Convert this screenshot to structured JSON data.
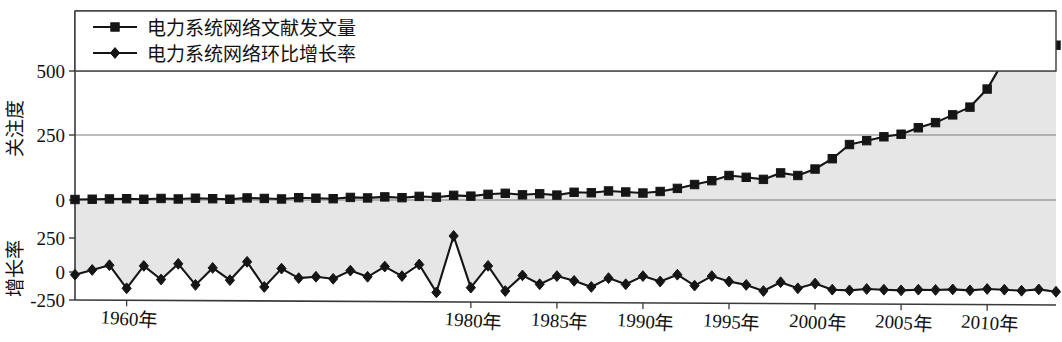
{
  "chart_data": {
    "type": "line",
    "title": "",
    "subtitle": "",
    "xlabel": "",
    "ylabel_top": "关注度",
    "ylabel_bottom": "增长率",
    "grid": true,
    "legend_position": "top-left",
    "panels": [
      {
        "name": "top",
        "ylabel": "关注度",
        "yticks": [
          0,
          250,
          500
        ],
        "ytick_labels": [
          "0",
          "250",
          "500"
        ],
        "ylim": [
          -40,
          660
        ],
        "fill": true,
        "fill_color": "#e6e6e6"
      },
      {
        "name": "bottom",
        "ylabel": "增长率",
        "yticks": [
          -250,
          0,
          250
        ],
        "ytick_labels": [
          "-250",
          "0",
          "250"
        ],
        "ylim": [
          -290,
          330
        ],
        "fill": false
      }
    ],
    "x": [
      1957,
      1958,
      1959,
      1960,
      1961,
      1962,
      1963,
      1964,
      1965,
      1966,
      1967,
      1968,
      1969,
      1970,
      1971,
      1972,
      1973,
      1974,
      1975,
      1976,
      1977,
      1978,
      1979,
      1980,
      1981,
      1982,
      1983,
      1984,
      1985,
      1986,
      1987,
      1988,
      1989,
      1990,
      1991,
      1992,
      1993,
      1994,
      1995,
      1996,
      1997,
      1998,
      1999,
      2000,
      2001,
      2002,
      2003,
      2004,
      2005,
      2006,
      2007,
      2008,
      2009,
      2010,
      2011,
      2012,
      2013,
      2014
    ],
    "xticks": [
      1960,
      1980,
      1985,
      1990,
      1995,
      2000,
      2005,
      2010
    ],
    "xtick_labels": [
      "1960年",
      "1980年",
      "1985年",
      "1990年",
      "1995年",
      "2000年",
      "2005年",
      "2010年"
    ],
    "series": [
      {
        "name": "电力系统网络文献发文量",
        "panel": "top",
        "marker": "square",
        "color": "#151515",
        "values": [
          2,
          3,
          4,
          5,
          3,
          6,
          4,
          7,
          5,
          3,
          8,
          6,
          4,
          9,
          7,
          5,
          10,
          8,
          12,
          9,
          14,
          11,
          18,
          15,
          22,
          26,
          20,
          24,
          19,
          30,
          28,
          35,
          31,
          27,
          33,
          45,
          60,
          75,
          95,
          88,
          80,
          105,
          95,
          120,
          160,
          215,
          230,
          245,
          255,
          280,
          300,
          330,
          360,
          430,
          545,
          600,
          605,
          600
        ]
      },
      {
        "name": "电力系统网络环比增长率",
        "panel": "bottom",
        "marker": "diamond",
        "color": "#151515",
        "values": [
          -20,
          15,
          50,
          -120,
          45,
          -55,
          60,
          -95,
          30,
          -60,
          75,
          -110,
          25,
          -45,
          -35,
          -50,
          10,
          -35,
          40,
          -30,
          55,
          -150,
          265,
          -115,
          45,
          -140,
          -25,
          -90,
          -30,
          -65,
          -110,
          -45,
          -90,
          -30,
          -70,
          -20,
          -100,
          -30,
          -70,
          -95,
          -140,
          -75,
          -120,
          -85,
          -130,
          -135,
          -125,
          -130,
          -135,
          -130,
          -132,
          -128,
          -135,
          -125,
          -130,
          -138,
          -128,
          -145
        ]
      }
    ]
  },
  "legend": {
    "entries": [
      {
        "label": "电力系统网络文献发文量",
        "marker": "square"
      },
      {
        "label": "电力系统网络环比增长率",
        "marker": "diamond"
      }
    ]
  },
  "axes": {
    "top": {
      "label": "关注度",
      "ticks": [
        "500",
        "250",
        "0"
      ]
    },
    "bottom": {
      "label": "增长率",
      "ticks": [
        "250",
        "0",
        "-250"
      ]
    },
    "x_ticks": [
      "1960年",
      "1980年",
      "1985年",
      "1990年",
      "1995年",
      "2000年",
      "2005年",
      "2010年"
    ]
  },
  "colors": {
    "line": "#151515",
    "fill": "#e6e6e6",
    "grid": "#7a7a7a",
    "axis": "#3a3a3a",
    "text": "#111111"
  }
}
